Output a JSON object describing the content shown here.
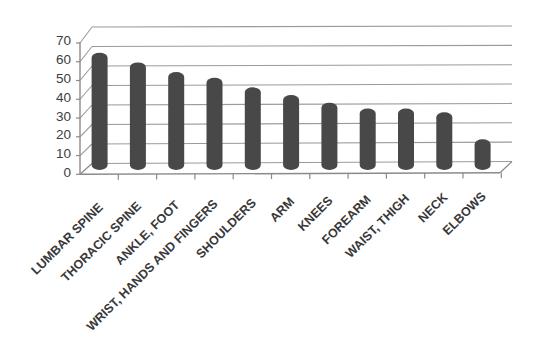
{
  "figure": {
    "background": "#ffffff"
  },
  "chart_data": {
    "type": "bar",
    "style": "3d-cylinder-column",
    "title": "",
    "xlabel": "",
    "ylabel": "",
    "categories": [
      "LUMBAR SPINE",
      "THORACIC SPINE",
      "ANKLE, FOOT",
      "WRIST, HANDS AND FINGERS",
      "SHOULDERS",
      "ARM",
      "KNEES",
      "FOREARM",
      "WAIST, THIGH",
      "NECK",
      "ELBOWS"
    ],
    "values": [
      60,
      55,
      50,
      47,
      42,
      38,
      34,
      31,
      31,
      29,
      15
    ],
    "ylim": [
      0,
      70
    ],
    "yticks": [
      0,
      10,
      20,
      30,
      40,
      50,
      60,
      70
    ],
    "ytick_interval": 10,
    "grid": true,
    "legend": false,
    "category_label_rotation_deg": 45,
    "colors": {
      "bar": "#484848",
      "grid": "#9b9b9b",
      "axis": "#8a8a8a",
      "tick_label": "#3d3d3d",
      "category_label": "#383838"
    }
  }
}
